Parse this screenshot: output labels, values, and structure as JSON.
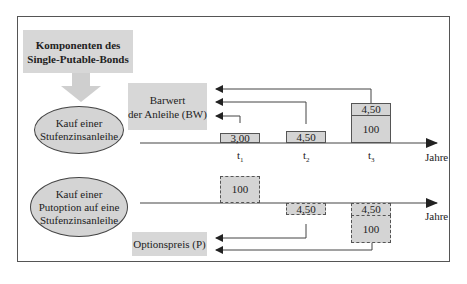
{
  "title_box": {
    "line1": "Komponenten des",
    "line2": "Single-Putable-Bonds"
  },
  "component1": {
    "line1": "Kauf einer",
    "line2": "Stufenzinsanleihe"
  },
  "component2": {
    "line1": "Kauf einer",
    "line2": "Putoption auf eine",
    "line3": "Stufenzinsanleihe"
  },
  "barwert_box": {
    "line1": "Barwert",
    "line2": "der Anleihe (BW)"
  },
  "optionspreis_box": {
    "label": "Optionspreis (P)"
  },
  "timeline1": {
    "axis_label": "Jahre",
    "ticks": [
      {
        "t": "t",
        "sub": "1"
      },
      {
        "t": "t",
        "sub": "2"
      },
      {
        "t": "t",
        "sub": "3"
      }
    ],
    "cashflows": {
      "t1": "3,00",
      "t2": "4,50",
      "t3_coupon": "4,50",
      "t3_principal": "100"
    }
  },
  "timeline2": {
    "axis_label": "Jahre",
    "cashflows": {
      "t1": "100",
      "t2": "4,50",
      "t3_coupon": "4,50",
      "t3_principal": "100"
    }
  },
  "colors": {
    "box_fill": "#d7d7d7",
    "line": "#444444",
    "arrow_big": "#cfcfcf"
  }
}
